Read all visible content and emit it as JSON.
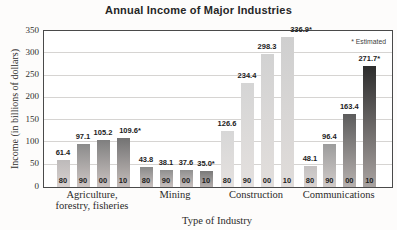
{
  "chart_data": {
    "type": "bar",
    "title": "Annual Income of Major Industries",
    "ylabel": "Income (in billions of dollars)",
    "xlabel": "Type of Industry",
    "note": "* Estimated",
    "ylim": [
      0,
      350
    ],
    "yticks": [
      0,
      50,
      100,
      150,
      200,
      250,
      300,
      350
    ],
    "grid": "horizontal",
    "legend": "none",
    "years": [
      "80",
      "90",
      "00",
      "10"
    ],
    "categories": [
      "Agriculture, forestry, fisheries",
      "Mining",
      "Construction",
      "Communications"
    ],
    "category_label_lines": [
      [
        "Agriculture,",
        "forestry, fisheries"
      ],
      [
        "Mining"
      ],
      [
        "Construction"
      ],
      [
        "Communications"
      ]
    ],
    "groups": [
      {
        "category": "Agriculture, forestry, fisheries",
        "values": [
          61.4,
          97.1,
          105.2,
          109.6
        ],
        "value_labels": [
          "61.4",
          "97.1",
          "105.2",
          "109.6*"
        ],
        "estimated": [
          false,
          false,
          false,
          true
        ],
        "bar_colors_top": [
          "#bdbaba",
          "#8b8b8b",
          "#7f7f7f",
          "#737373"
        ],
        "bar_colors_bottom": [
          "#d8d1cf",
          "#cec6c4",
          "#cbc3c1",
          "#c5bdbb"
        ]
      },
      {
        "category": "Mining",
        "values": [
          43.8,
          38.1,
          37.6,
          35.0
        ],
        "value_labels": [
          "43.8",
          "38.1",
          "37.6",
          "35.0*"
        ],
        "estimated": [
          false,
          false,
          false,
          true
        ],
        "bar_colors_top": [
          "#8a8a8a",
          "#909090",
          "#909090",
          "#7a7a7a"
        ],
        "bar_colors_bottom": [
          "#c8c0be",
          "#c8c0be",
          "#c8c0be",
          "#b3adab"
        ]
      },
      {
        "category": "Construction",
        "values": [
          126.6,
          234.4,
          298.3,
          336.9
        ],
        "value_labels": [
          "126.6",
          "234.4",
          "298.3",
          "336.9*"
        ],
        "estimated": [
          false,
          false,
          false,
          true
        ],
        "bar_colors_top": [
          "#d7d7d7",
          "#d5d5d5",
          "#d2d2d2",
          "#cfcfcf"
        ],
        "bar_colors_bottom": [
          "#e5e1df",
          "#e4e0de",
          "#e2dedc",
          "#e0dcda"
        ]
      },
      {
        "category": "Communications",
        "values": [
          48.1,
          96.4,
          163.4,
          271.7
        ],
        "value_labels": [
          "48.1",
          "96.4",
          "163.4",
          "271.7*"
        ],
        "estimated": [
          false,
          false,
          false,
          true
        ],
        "bar_colors_top": [
          "#c4c1c1",
          "#9c9c9c",
          "#5c5c5c",
          "#2d2d2d"
        ],
        "bar_colors_bottom": [
          "#d9d3d1",
          "#d1cbc9",
          "#b7b1af",
          "#a9a3a1"
        ]
      }
    ]
  }
}
